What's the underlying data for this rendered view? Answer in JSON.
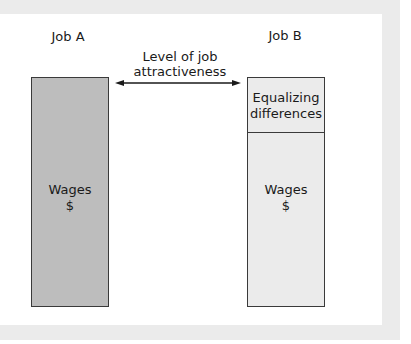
{
  "diagram": {
    "job_a": {
      "title": "Job A",
      "segments": [
        {
          "label_line1": "Wages",
          "label_line2": "$",
          "fill": "#bdbdbd"
        }
      ]
    },
    "job_b": {
      "title": "Job B",
      "segments": [
        {
          "label_line1": "Equalizing",
          "label_line2": "differences",
          "fill": "#ebebeb"
        },
        {
          "label_line1": "Wages",
          "label_line2": "$",
          "fill": "#ebebeb"
        }
      ]
    },
    "arrow": {
      "label_line1": "Level of job",
      "label_line2": "attractiveness",
      "direction": "bidirectional"
    }
  }
}
